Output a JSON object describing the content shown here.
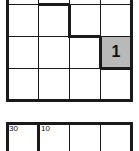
{
  "puzzle_top": {
    "columns": 4,
    "visible_rows": 3,
    "cells": [
      {
        "row": 2,
        "col": 3,
        "value": "1",
        "shaded": true
      }
    ]
  },
  "puzzle_bottom": {
    "columns": 4,
    "cage_labels": [
      {
        "row": 0,
        "col": 0,
        "label": "30"
      },
      {
        "row": 0,
        "col": 1,
        "label": "10"
      }
    ]
  },
  "colors": {
    "line": "#1a1a1a",
    "shaded_cell": "#b9b9b9",
    "background": "#ffffff"
  }
}
